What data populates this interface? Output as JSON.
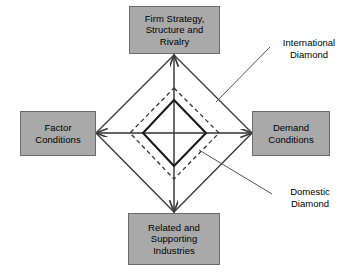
{
  "diagram": {
    "colors": {
      "box_fill": "#a9a9a9",
      "box_border": "#6b6b6b",
      "outer_diamond": "#3b3b3b",
      "dashed_diamond": "#333333",
      "inner_diamond": "#1a1a1a",
      "axis_line": "#c8c8c8",
      "leader_line": "#555555",
      "background": "#ffffff",
      "text": "#000000"
    },
    "nodes": [
      {
        "id": "firm-strategy",
        "label": "Firm Strategy,\nStructure and\nRivalry",
        "position": "top"
      },
      {
        "id": "factor-conditions",
        "label": "Factor\nConditions",
        "position": "left"
      },
      {
        "id": "demand-conditions",
        "label": "Demand\nConditions",
        "position": "right"
      },
      {
        "id": "related-supporting",
        "label": "Related and\nSupporting\nIndustries",
        "position": "bottom"
      }
    ],
    "annotations": [
      {
        "id": "international-diamond",
        "label": "International\nDiamond",
        "points_to": "dashed-diamond"
      },
      {
        "id": "domestic-diamond",
        "label": "Domestic\nDiamond",
        "points_to": "inner-diamond"
      }
    ],
    "shapes": {
      "center": {
        "x": 174,
        "y": 133
      },
      "outer_diamond": {
        "style": "solid",
        "stroke_width": 1.4,
        "vertices": [
          {
            "x": 174,
            "y": 55
          },
          {
            "x": 252,
            "y": 133
          },
          {
            "x": 174,
            "y": 212
          },
          {
            "x": 96,
            "y": 133
          }
        ],
        "arrowheads": [
          "top",
          "right",
          "bottom",
          "left"
        ]
      },
      "dashed_diamond": {
        "style": "dashed",
        "stroke_width": 1.3,
        "vertices": [
          {
            "x": 174,
            "y": 88
          },
          {
            "x": 219,
            "y": 133
          },
          {
            "x": 174,
            "y": 179
          },
          {
            "x": 130,
            "y": 133
          }
        ]
      },
      "inner_diamond": {
        "style": "solid",
        "stroke_width": 2.1,
        "vertices": [
          {
            "x": 174,
            "y": 100
          },
          {
            "x": 206,
            "y": 133
          },
          {
            "x": 174,
            "y": 166
          },
          {
            "x": 143,
            "y": 133
          }
        ]
      },
      "axes": {
        "horizontal": {
          "x1": 96,
          "y1": 133,
          "x2": 252,
          "y2": 133
        },
        "vertical": {
          "x1": 174,
          "y1": 55,
          "x2": 174,
          "y2": 212
        }
      },
      "leaders": [
        {
          "id": "leader-international",
          "x1": 270,
          "y1": 47,
          "x2": 216,
          "y2": 102
        },
        {
          "id": "leader-domestic",
          "x1": 199,
          "y1": 150,
          "x2": 272,
          "y2": 194
        }
      ]
    }
  }
}
